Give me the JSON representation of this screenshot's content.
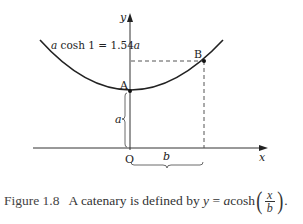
{
  "figure": {
    "axes": {
      "x_label": "x",
      "y_label": "y",
      "origin_label": "O"
    },
    "points": [
      {
        "id": "A",
        "label": "A"
      },
      {
        "id": "B",
        "label": "B"
      }
    ],
    "annotations": {
      "height_at_b": "a cosh 1 = 1.54a",
      "height_at_b_parts": {
        "a1": "a",
        "mid": " cosh 1 = 1.54",
        "a2": "a"
      },
      "vertical_brace_label": "a",
      "horizontal_brace_label": "b"
    },
    "curve": {
      "name": "catenary",
      "equation": "y = a cosh(x/b)"
    },
    "colors": {
      "curve": "#222222",
      "axes": "#333333",
      "dashed": "#555555"
    }
  },
  "caption": {
    "number": "Figure 1.8",
    "text": "A catenary is defined by",
    "eq_lhs": "y",
    "eq_eq": " = ",
    "eq_a": "a",
    "eq_fn": "cosh",
    "eq_num": "x",
    "eq_den": "b",
    "period": "."
  }
}
